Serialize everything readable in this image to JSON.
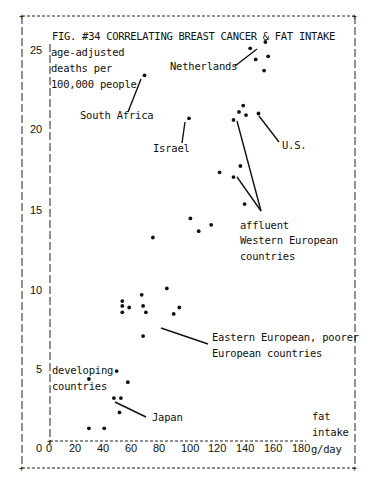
{
  "chart_data": {
    "type": "scatter",
    "title": "FIG. #34  CORRELATING BREAST CANCER & FAT INTAKE",
    "ylabel": "age-adjusted deaths per 100,000 people",
    "xlabel": "fat intake g/day",
    "xlim": [
      0,
      180
    ],
    "ylim": [
      0,
      25
    ],
    "x_ticks": [
      "0",
      "20",
      "40",
      "60",
      "80",
      "100",
      "120",
      "140",
      "160",
      "180"
    ],
    "y_ticks": [
      "0",
      "5",
      "10",
      "15",
      "20",
      "25"
    ],
    "grid": false,
    "points": [
      {
        "x": 68,
        "y": 23.5,
        "label": "South Africa"
      },
      {
        "x": 100,
        "y": 20.8,
        "label": "Israel"
      },
      {
        "x": 144,
        "y": 25.2,
        "label": "Netherlands"
      },
      {
        "x": 155,
        "y": 25.6
      },
      {
        "x": 148,
        "y": 24.5
      },
      {
        "x": 157,
        "y": 24.7
      },
      {
        "x": 154,
        "y": 23.8
      },
      {
        "x": 139,
        "y": 21.6
      },
      {
        "x": 136,
        "y": 21.2
      },
      {
        "x": 141,
        "y": 21.0
      },
      {
        "x": 132,
        "y": 20.7
      },
      {
        "x": 150,
        "y": 21.1,
        "label": "U.S."
      },
      {
        "x": 122,
        "y": 17.4
      },
      {
        "x": 137,
        "y": 17.8
      },
      {
        "x": 132,
        "y": 17.1
      },
      {
        "x": 140,
        "y": 15.4
      },
      {
        "x": 101,
        "y": 14.5
      },
      {
        "x": 107,
        "y": 13.7
      },
      {
        "x": 116,
        "y": 14.1
      },
      {
        "x": 74,
        "y": 13.3
      },
      {
        "x": 52,
        "y": 9.3
      },
      {
        "x": 52,
        "y": 9.0
      },
      {
        "x": 52,
        "y": 8.6
      },
      {
        "x": 57,
        "y": 8.9
      },
      {
        "x": 66,
        "y": 9.7
      },
      {
        "x": 67,
        "y": 9.0
      },
      {
        "x": 69,
        "y": 8.6
      },
      {
        "x": 84,
        "y": 10.1
      },
      {
        "x": 89,
        "y": 8.5
      },
      {
        "x": 93,
        "y": 8.9
      },
      {
        "x": 67,
        "y": 7.1
      },
      {
        "x": 48,
        "y": 4.9
      },
      {
        "x": 28,
        "y": 4.4
      },
      {
        "x": 56,
        "y": 4.2
      },
      {
        "x": 46,
        "y": 3.2
      },
      {
        "x": 51,
        "y": 3.2
      },
      {
        "x": 50,
        "y": 2.3
      },
      {
        "x": 28,
        "y": 1.3
      },
      {
        "x": 39,
        "y": 1.3
      }
    ],
    "annotations": [
      {
        "text": "Netherlands"
      },
      {
        "text": "South Africa"
      },
      {
        "text": "Israel"
      },
      {
        "text": "U.S."
      },
      {
        "text": "affluent Western European countries"
      },
      {
        "text": "Eastern European, poorer European countries"
      },
      {
        "text": "developing countries"
      },
      {
        "text": "Japan"
      }
    ]
  },
  "labels": {
    "title": "FIG. #34  CORRELATING BREAST CANCER & FAT INTAKE",
    "ylabel_1": "age-adjusted",
    "ylabel_2": "deaths per",
    "ylabel_3": "100,000 people",
    "netherlands": "Netherlands",
    "south_africa": "South Africa",
    "israel": "Israel",
    "us": "U.S.",
    "affluent_1": "affluent",
    "affluent_2": "Western European",
    "affluent_3": "countries",
    "eastern_1": "Eastern European, poorer",
    "eastern_2": "European countries",
    "developing_1": "developing",
    "developing_2": "countries",
    "japan": "Japan",
    "xlabel_1": "fat",
    "xlabel_2": "intake",
    "xlabel_3": "g/day"
  },
  "ticks": {
    "y": [
      "25",
      "20",
      "15",
      "10",
      "5",
      "0"
    ],
    "x": [
      "0",
      "20",
      "40",
      "60",
      "80",
      "100",
      "120",
      "140",
      "160",
      "180"
    ]
  }
}
